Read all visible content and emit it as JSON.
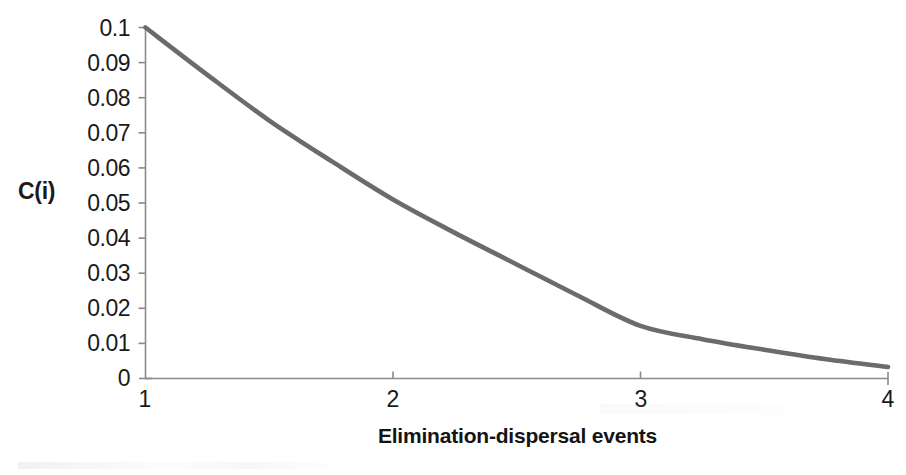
{
  "chart_data": {
    "type": "line",
    "title": "",
    "xlabel": "Elimination-dispersal events",
    "ylabel": "C(i)",
    "xlim": [
      1,
      4
    ],
    "ylim": [
      0,
      0.1
    ],
    "grid": false,
    "legend": "none",
    "line_color": "#6b6b6b",
    "axis_color": "#808080",
    "x_ticks": [
      "1",
      "2",
      "3",
      "4"
    ],
    "y_ticks": [
      "0.1",
      "0.09",
      "0.08",
      "0.07",
      "0.06",
      "0.05",
      "0.04",
      "0.03",
      "0.02",
      "0.01",
      "0"
    ],
    "x": [
      1,
      1.25,
      1.5,
      1.75,
      2,
      2.25,
      2.5,
      2.75,
      3,
      3.25,
      3.5,
      3.75,
      4
    ],
    "y": [
      0.1,
      0.0865,
      0.0735,
      0.062,
      0.051,
      0.0415,
      0.0325,
      0.0235,
      0.015,
      0.0112,
      0.0082,
      0.0055,
      0.0033
    ],
    "series": [
      {
        "name": "C(i)",
        "values": [
          0.1,
          0.0865,
          0.0735,
          0.062,
          0.051,
          0.0415,
          0.0325,
          0.0235,
          0.015,
          0.0112,
          0.0082,
          0.0055,
          0.0033
        ]
      }
    ]
  },
  "axes": {
    "y_label_text": "C(i)",
    "x_label_text": "Elimination-dispersal events",
    "y_tick_labels": [
      "0.1",
      "0.09",
      "0.08",
      "0.07",
      "0.06",
      "0.05",
      "0.04",
      "0.03",
      "0.02",
      "0.01",
      "0"
    ],
    "x_tick_labels": [
      "1",
      "2",
      "3",
      "4"
    ]
  }
}
